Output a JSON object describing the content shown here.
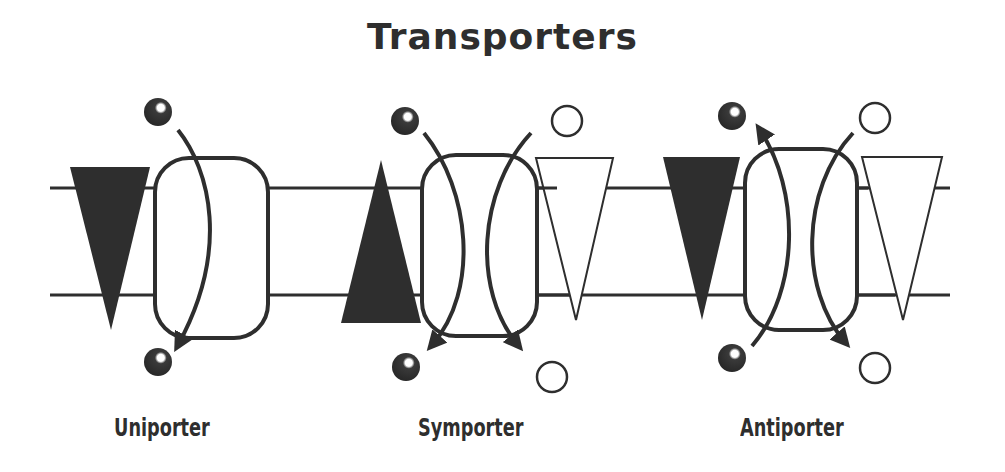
{
  "title": "Transporters",
  "colors": {
    "ink": "#2e2e2e",
    "background": "#ffffff",
    "open_fill": "#ffffff"
  },
  "membrane": {
    "top_y": 188,
    "bottom_y": 295,
    "x_start": 50,
    "x_end": 950
  },
  "transporters": [
    {
      "name": "Uniporter",
      "label": "Uniporter",
      "solutes": [
        {
          "type": "filled-sphere",
          "direction": "in"
        }
      ],
      "gradients": [
        {
          "fill": "filled",
          "orientation": "down"
        }
      ]
    },
    {
      "name": "Symporter",
      "label": "Symporter",
      "solutes": [
        {
          "type": "filled-sphere",
          "direction": "in"
        },
        {
          "type": "open-circle",
          "direction": "in"
        }
      ],
      "gradients": [
        {
          "fill": "filled",
          "orientation": "up"
        },
        {
          "fill": "open",
          "orientation": "down"
        }
      ]
    },
    {
      "name": "Antiporter",
      "label": "Antiporter",
      "solutes": [
        {
          "type": "filled-sphere",
          "direction": "out"
        },
        {
          "type": "open-circle",
          "direction": "in"
        }
      ],
      "gradients": [
        {
          "fill": "filled",
          "orientation": "down"
        },
        {
          "fill": "open",
          "orientation": "down"
        }
      ]
    }
  ]
}
